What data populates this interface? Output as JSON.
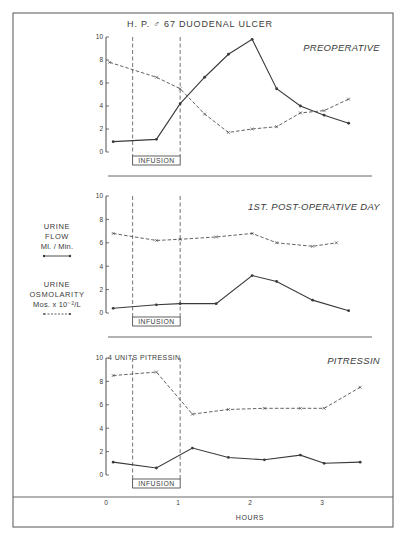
{
  "title": "H. P. ♂ 67 DUODENAL ULCER",
  "legend": {
    "flow": {
      "line1": "URINE",
      "line2": "FLOW",
      "line3": "Ml. / Min.",
      "style": "solid line with dots"
    },
    "osm": {
      "line1": "URINE",
      "line2": "OSMOLARITY",
      "line3": "Mos. x 10⁻²/L",
      "style": "dashed line with x"
    }
  },
  "x_axis": {
    "label": "HOURS",
    "ticks": [
      "0",
      "1",
      "2",
      "3"
    ]
  },
  "infusion_label": "INFUSION",
  "pitressin_note": "4 UNITS PITRESSIN",
  "colors": {
    "ink": "#3a3a3a",
    "background": "#ffffff"
  },
  "chart_data": [
    {
      "type": "line",
      "title": "PREOPERATIVE",
      "xlabel": "HOURS",
      "ylabel": "",
      "xlim": [
        0,
        3.6
      ],
      "ylim": [
        0,
        10
      ],
      "yticks": [
        0,
        2,
        4,
        6,
        8,
        10
      ],
      "infusion_window_hours": [
        0.37,
        1.03
      ],
      "series": [
        {
          "name": "Urine Flow (Ml/Min)",
          "style": "solid",
          "marker": "dot",
          "x": [
            0.1,
            0.7,
            1.03,
            1.37,
            1.7,
            2.03,
            2.37,
            2.7,
            3.03,
            3.37
          ],
          "values": [
            0.9,
            1.1,
            4.2,
            6.5,
            8.5,
            9.8,
            5.5,
            4.0,
            3.2,
            2.5
          ]
        },
        {
          "name": "Urine Osmolarity (Mos x 10^-2/L)",
          "style": "dashed",
          "marker": "x",
          "x": [
            0.05,
            0.7,
            1.03,
            1.37,
            1.7,
            2.03,
            2.37,
            2.7,
            3.03,
            3.37
          ],
          "values": [
            7.8,
            6.5,
            5.5,
            3.3,
            1.7,
            2.0,
            2.2,
            3.4,
            3.6,
            4.6
          ]
        }
      ]
    },
    {
      "type": "line",
      "title": "1ST. POST-OPERATIVE DAY",
      "xlabel": "HOURS",
      "ylabel": "",
      "xlim": [
        0,
        3.6
      ],
      "ylim": [
        0,
        10
      ],
      "yticks": [
        0,
        2,
        4,
        6,
        8,
        10
      ],
      "infusion_window_hours": [
        0.37,
        1.03
      ],
      "series": [
        {
          "name": "Urine Flow (Ml/Min)",
          "style": "solid",
          "marker": "dot",
          "x": [
            0.1,
            0.7,
            1.03,
            1.53,
            2.03,
            2.37,
            2.87,
            3.37
          ],
          "values": [
            0.4,
            0.7,
            0.8,
            0.8,
            3.2,
            2.7,
            1.1,
            0.2
          ]
        },
        {
          "name": "Urine Osmolarity (Mos x 10^-2/L)",
          "style": "dashed",
          "marker": "x",
          "x": [
            0.1,
            0.7,
            1.03,
            1.53,
            2.03,
            2.37,
            2.87,
            3.2
          ],
          "values": [
            6.8,
            6.2,
            6.3,
            6.5,
            6.8,
            6.0,
            5.7,
            6.0
          ]
        }
      ]
    },
    {
      "type": "line",
      "title": "PITRESSIN",
      "xlabel": "HOURS",
      "ylabel": "",
      "xlim": [
        0,
        3.6
      ],
      "ylim": [
        0,
        10
      ],
      "yticks": [
        0,
        2,
        4,
        6,
        8,
        10
      ],
      "infusion_window_hours": [
        0.37,
        1.03
      ],
      "annotation": "4 UNITS PITRESSIN",
      "series": [
        {
          "name": "Urine Flow (Ml/Min)",
          "style": "solid",
          "marker": "dot",
          "x": [
            0.1,
            0.7,
            1.2,
            1.7,
            2.2,
            2.7,
            3.03,
            3.53
          ],
          "values": [
            1.1,
            0.6,
            2.3,
            1.5,
            1.3,
            1.7,
            1.0,
            1.1
          ]
        },
        {
          "name": "Urine Osmolarity (Mos x 10^-2/L)",
          "style": "dashed",
          "marker": "x",
          "x": [
            0.1,
            0.7,
            1.2,
            1.7,
            2.2,
            2.7,
            3.03,
            3.53
          ],
          "values": [
            8.5,
            8.8,
            5.2,
            5.6,
            5.7,
            5.7,
            5.7,
            7.5
          ]
        }
      ]
    }
  ]
}
